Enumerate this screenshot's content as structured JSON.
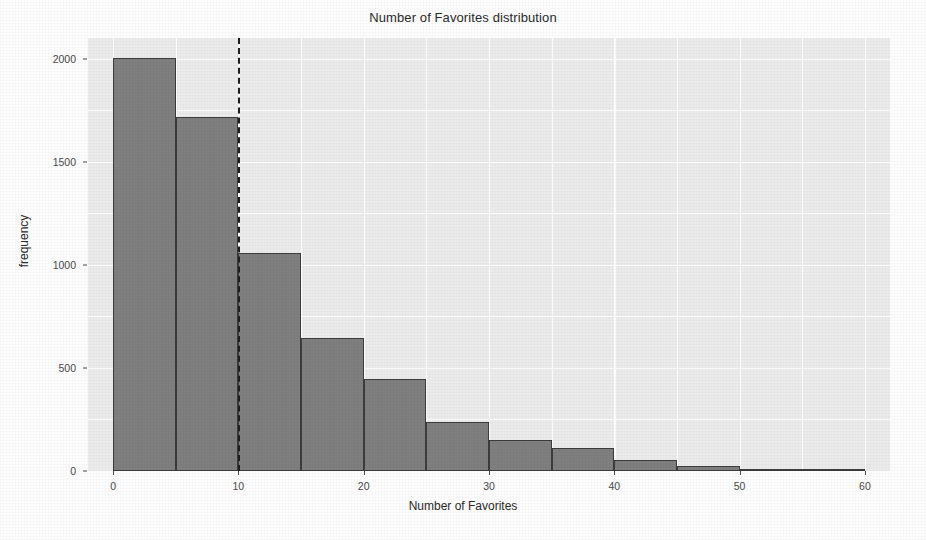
{
  "chart_data": {
    "type": "bar",
    "title": "Number of Favorites distribution",
    "xlabel": "Number of Favorites",
    "ylabel": "frequency",
    "grid": true,
    "legend": "none",
    "bin_width": 5,
    "xlim": [
      -2,
      62
    ],
    "ylim": [
      0,
      2100
    ],
    "x_ticks": [
      0,
      10,
      20,
      30,
      40,
      50,
      60
    ],
    "x_tick_labels": [
      "0",
      "10",
      "20",
      "30",
      "40",
      "50",
      "60"
    ],
    "y_ticks": [
      0,
      500,
      1000,
      1500,
      2000
    ],
    "y_tick_labels": [
      "0",
      "500",
      "1000",
      "1500",
      "2000"
    ],
    "bin_edges": [
      0,
      5,
      10,
      15,
      20,
      25,
      30,
      35,
      40,
      45,
      50,
      55,
      60
    ],
    "categories": [
      "0-5",
      "5-10",
      "10-15",
      "15-20",
      "20-25",
      "25-30",
      "30-35",
      "35-40",
      "40-45",
      "45-50",
      "50-55",
      "55-60"
    ],
    "values": [
      2005,
      1715,
      1055,
      645,
      445,
      240,
      152,
      110,
      55,
      22,
      10,
      5
    ],
    "annotations": [
      {
        "type": "vline",
        "x": 10,
        "style": "dashed",
        "color": "#1e1e1e"
      }
    ],
    "colors": {
      "bar_fill": "#7f7f7f",
      "bar_outline": "#3c3c3c",
      "panel_background": "#ebebeb",
      "grid_color": "#ffffff",
      "axis_text": "#4a4a4a",
      "title_text": "#2b2b2b"
    }
  }
}
